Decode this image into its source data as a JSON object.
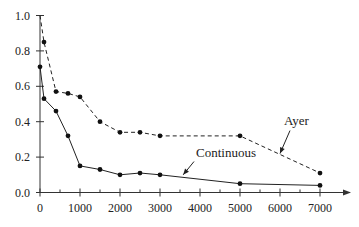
{
  "chart_data": {
    "type": "line",
    "title": "",
    "xlabel": "",
    "ylabel": "",
    "xlim": [
      0,
      7600
    ],
    "ylim": [
      0,
      1.0
    ],
    "grid": false,
    "legend": "none (inline annotations with arrows)",
    "x_ticks": [
      0,
      1000,
      2000,
      3000,
      4000,
      5000,
      6000,
      7000
    ],
    "x_tick_labels": [
      "0",
      "1000",
      "2000",
      "3000",
      "4000",
      "5000",
      "6000",
      "7000"
    ],
    "x_minor_ticks": [
      500,
      1500,
      2500,
      3500,
      4500,
      5500,
      6500
    ],
    "y_ticks": [
      0.0,
      0.2,
      0.4,
      0.6,
      0.8,
      1.0
    ],
    "y_tick_labels": [
      "0.0",
      "0.2",
      "0.4",
      "0.6",
      "0.8",
      "1.0"
    ],
    "series": [
      {
        "name": "Ayer",
        "style": "dashed",
        "x": [
          0,
          100,
          400,
          700,
          1000,
          1500,
          2000,
          2500,
          3000,
          5000,
          7000
        ],
        "values": [
          1.0,
          0.85,
          0.57,
          0.56,
          0.54,
          0.4,
          0.34,
          0.34,
          0.32,
          0.32,
          0.11
        ],
        "markers": [
          false,
          true,
          true,
          true,
          true,
          true,
          true,
          true,
          true,
          true,
          true
        ]
      },
      {
        "name": "Continuous",
        "style": "solid",
        "x": [
          0,
          100,
          400,
          700,
          1000,
          1500,
          2000,
          2500,
          3000,
          5000,
          7000
        ],
        "values": [
          0.71,
          0.53,
          0.46,
          0.32,
          0.15,
          0.13,
          0.1,
          0.11,
          0.1,
          0.05,
          0.04
        ],
        "markers": [
          true,
          true,
          true,
          true,
          true,
          true,
          true,
          true,
          true,
          true,
          true
        ]
      }
    ],
    "annotations": [
      {
        "text": "Ayer",
        "series": "Ayer",
        "text_x": 6100,
        "text_y": 0.38,
        "arrow_from": [
          6250,
          0.35
        ],
        "arrow_to": [
          6000,
          0.22
        ]
      },
      {
        "text": "Continuous",
        "series": "Continuous",
        "text_x": 3900,
        "text_y": 0.2,
        "arrow_from": [
          3850,
          0.175
        ],
        "arrow_to": [
          3580,
          0.1
        ]
      }
    ]
  }
}
